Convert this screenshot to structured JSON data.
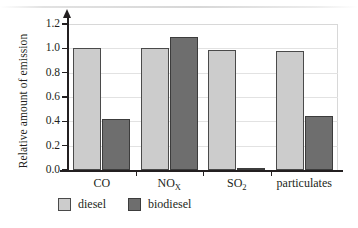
{
  "chart_data": {
    "type": "bar",
    "title": "",
    "xlabel": "",
    "ylabel": "Relative amount of emission",
    "categories": [
      "CO",
      "NOX",
      "SO2",
      "particulates"
    ],
    "category_labels": [
      {
        "base": "CO",
        "sub": ""
      },
      {
        "base": "NO",
        "sub": "X"
      },
      {
        "base": "SO",
        "sub": "2"
      },
      {
        "base": "particulates",
        "sub": ""
      }
    ],
    "series": [
      {
        "name": "diesel",
        "color": "#cccccc",
        "values": [
          1.0,
          1.0,
          0.99,
          0.98
        ]
      },
      {
        "name": "biodiesel",
        "color": "#6e6e6e",
        "values": [
          0.42,
          1.09,
          0.015,
          0.44
        ]
      }
    ],
    "ylim": [
      0.0,
      1.2
    ],
    "ytick_values": [
      0.0,
      0.2,
      0.4,
      0.6,
      0.8,
      1.0,
      1.2
    ],
    "ytick_labels": [
      "0.0",
      "0.2",
      "0.4",
      "0.6",
      "0.8",
      "1.0",
      "1.2"
    ],
    "grid": true,
    "grid_axis": "y",
    "legend_position": "bottom-left",
    "axis_arrow": "y-up"
  }
}
